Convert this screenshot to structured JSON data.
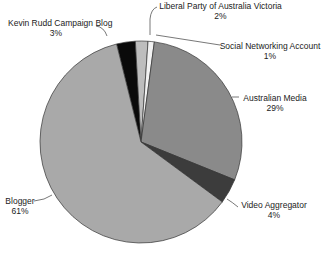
{
  "chart_data": {
    "type": "pie",
    "title": "",
    "categories": [
      "Kevin Rudd Campaign Blog",
      "Liberal Party of Australia Victoria",
      "Social Networking Account",
      "Australian Media",
      "Video Aggregator",
      "Blogger"
    ],
    "values": [
      3,
      2,
      1,
      29,
      4,
      61
    ],
    "value_labels": [
      "3%",
      "2%",
      "1%",
      "29%",
      "4%",
      "61%"
    ],
    "colors": [
      "#0a0a0a",
      "#bdbdbd",
      "#f2f2f2",
      "#8a8a8a",
      "#3c3c3c",
      "#a9a9a9"
    ],
    "start_angle_deg": -14,
    "direction": "clockwise",
    "legend": "none (callout labels)"
  },
  "labels": [
    {
      "name": "Kevin Rudd Campaign Blog",
      "pct": "3%"
    },
    {
      "name": "Liberal Party of Australia Victoria",
      "pct": "2%"
    },
    {
      "name": "Social Networking Account",
      "pct": "1%"
    },
    {
      "name": "Australian Media",
      "pct": "29%"
    },
    {
      "name": "Video Aggregator",
      "pct": "4%"
    },
    {
      "name": "Blogger",
      "pct": "61%"
    }
  ]
}
